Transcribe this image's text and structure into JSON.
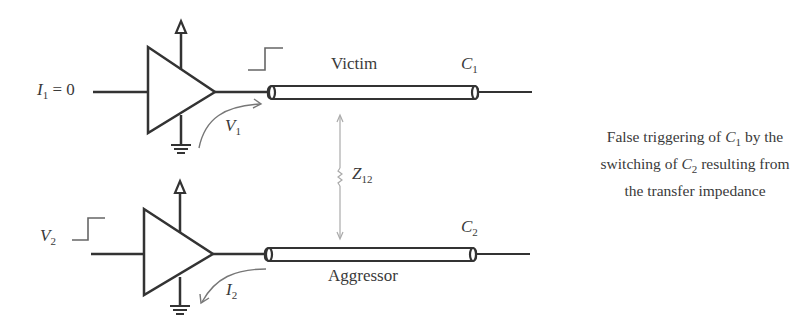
{
  "diagram": {
    "type": "crosstalk-circuit",
    "victim": {
      "input_label": "I",
      "input_sub": "1",
      "input_value": " = 0",
      "voltage_label": "V",
      "voltage_sub": "1",
      "line_label": "Victim",
      "receiver_label": "C",
      "receiver_sub": "1"
    },
    "aggressor": {
      "input_label": "V",
      "input_sub": "2",
      "current_label": "I",
      "current_sub": "2",
      "line_label": "Aggressor",
      "receiver_label": "C",
      "receiver_sub": "2"
    },
    "coupling": {
      "label": "Z",
      "sub": "12"
    },
    "description": {
      "line1_a": "False triggering of ",
      "line1_c": "C",
      "line1_sub": "1",
      "line1_b": " by the",
      "line2_a": "switching of ",
      "line2_c": "C",
      "line2_sub": "2",
      "line2_b": " resulting from",
      "line3": "the transfer impedance"
    },
    "colors": {
      "stroke": "#333333",
      "thin": "#999999"
    }
  }
}
